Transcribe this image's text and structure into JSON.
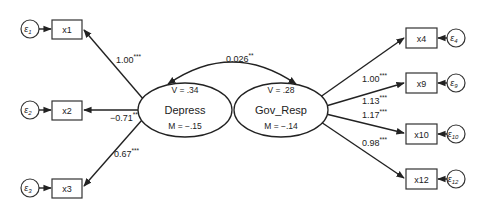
{
  "latent": {
    "depress": {
      "name": "Depress",
      "variance": "V = .34",
      "mean": "M = −.15"
    },
    "gov_resp": {
      "name": "Gov_Resp",
      "variance": "V = .28",
      "mean": "M = −.14"
    }
  },
  "covariance": {
    "value": "0.026",
    "stars": "**"
  },
  "observed": {
    "x1": {
      "name": "x1",
      "error": "ε",
      "error_sub": "1",
      "loading": "1.00",
      "stars": "***"
    },
    "x2": {
      "name": "x2",
      "error": "ε",
      "error_sub": "2",
      "loading": "−0.71",
      "stars": "***"
    },
    "x3": {
      "name": "x3",
      "error": "ε",
      "error_sub": "3",
      "loading": "0.67",
      "stars": "***"
    },
    "x4": {
      "name": "x4",
      "error": "ε",
      "error_sub": "4",
      "loading": "1.00",
      "stars": "***"
    },
    "x9": {
      "name": "x9",
      "error": "ε",
      "error_sub": "9",
      "loading": "1.13",
      "stars": "***"
    },
    "x10": {
      "name": "x10",
      "error": "ε",
      "error_sub": "10",
      "loading": "1.17",
      "stars": "***"
    },
    "x12": {
      "name": "x12",
      "error": "ε",
      "error_sub": "12",
      "loading": "0.98",
      "stars": "***"
    }
  }
}
